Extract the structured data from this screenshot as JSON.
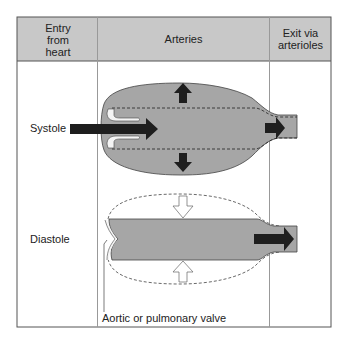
{
  "table": {
    "headers": [
      "Entry from heart",
      "Arteries",
      "Exit via arterioles"
    ],
    "header_lines": {
      "entry": [
        "Entry",
        "from",
        "heart"
      ],
      "arteries": [
        "Arteries"
      ],
      "exit": [
        "Exit via",
        "arterioles"
      ]
    },
    "rows": [
      {
        "label": "Systole",
        "description": "Blood enters arteries through open valve; arteries expand (outward arrows); blood exits to arterioles"
      },
      {
        "label": "Diastole",
        "description": "Valve closed; arteries recoil (inward hollow arrows); blood continues to exit to arterioles"
      }
    ]
  },
  "annotation": "Aortic or pulmonary valve",
  "colors": {
    "header_bg": "#c8c8c8",
    "vessel_fill": "#a6a6a6",
    "arrow_dark": "#1e1e1e",
    "grid": "#999999"
  }
}
